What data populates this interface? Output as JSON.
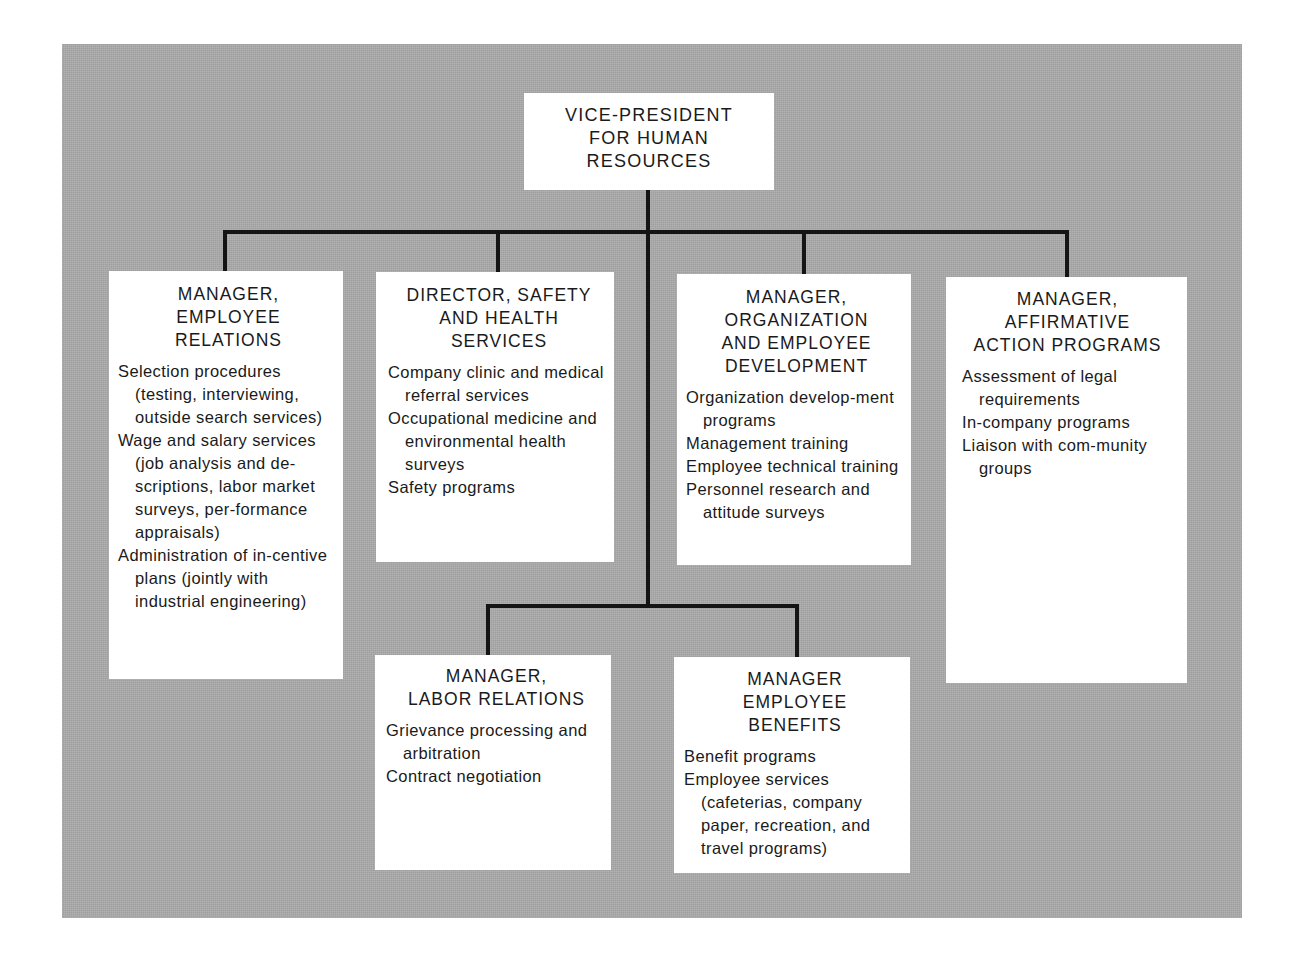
{
  "chart": {
    "type": "organization-chart",
    "colors": {
      "background": "#a9a9a9",
      "box": "#ffffff",
      "line": "#141414",
      "text": "#1a1a1a"
    },
    "top": {
      "title_lines": [
        "VICE-PRESIDENT",
        "FOR HUMAN",
        "RESOURCES"
      ]
    },
    "upper_row": [
      {
        "title_lines": [
          "MANAGER,",
          "EMPLOYEE",
          "RELATIONS"
        ],
        "duties": [
          "Selection procedures (testing, interviewing, outside search services)",
          "Wage and salary services (job analysis and de-scriptions, labor market surveys, per-formance appraisals)",
          "Administration of in-centive plans (jointly with industrial engineering)"
        ]
      },
      {
        "title_lines": [
          "DIRECTOR, SAFETY",
          "AND HEALTH",
          "SERVICES"
        ],
        "duties": [
          "Company clinic and medical referral services",
          "Occupational medicine and environmental health surveys",
          "Safety programs"
        ]
      },
      {
        "title_lines": [
          "MANAGER,",
          "ORGANIZATION",
          "AND EMPLOYEE",
          "DEVELOPMENT"
        ],
        "duties": [
          "Organization develop-ment programs",
          "Management training",
          "Employee technical training",
          "Personnel research and attitude surveys"
        ]
      },
      {
        "title_lines": [
          "MANAGER,",
          "AFFIRMATIVE",
          "ACTION PROGRAMS"
        ],
        "duties": [
          "Assessment of legal requirements",
          "In-company programs",
          "Liaison with com-munity groups"
        ]
      }
    ],
    "lower_row": [
      {
        "title_lines": [
          "MANAGER,",
          "LABOR RELATIONS"
        ],
        "duties": [
          "Grievance processing and arbitration",
          "Contract negotiation"
        ]
      },
      {
        "title_lines": [
          "MANAGER",
          "EMPLOYEE",
          "BENEFITS"
        ],
        "duties": [
          "Benefit programs",
          "Employee services (cafeterias, company paper, recreation, and travel programs)"
        ]
      }
    ]
  }
}
